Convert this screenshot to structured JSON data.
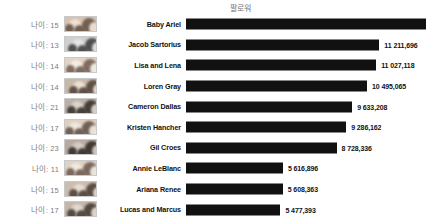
{
  "chart_data": {
    "type": "bar",
    "title": "팔로워",
    "xlabel": "",
    "ylabel": "",
    "orientation": "horizontal",
    "grid": false,
    "legend": false,
    "xlim": [
      0,
      13915130
    ],
    "categories": [
      "Baby Ariel",
      "Jacob Sartorius",
      "Lisa and Lena",
      "Loren Gray",
      "Cameron Dallas",
      "Kristen Hancher",
      "Gil Croes",
      "Annie LeBlanc",
      "Ariana Renee",
      "Lucas and Marcus"
    ],
    "values": [
      13915130,
      11211696,
      11027118,
      10495065,
      9633208,
      9286162,
      8728336,
      5616896,
      5608363,
      5477393
    ],
    "value_labels": [
      "13 915,130",
      "11 211,696",
      "11 027,118",
      "10 495,065",
      "9 633,208",
      "9 286,162",
      "8 728,336",
      "5 616,896",
      "5 608,363",
      "5 477,393"
    ],
    "bar_color": "#111111"
  },
  "rows": [
    {
      "age_label": "나이: 15",
      "name": "Baby Ariel",
      "value_label": "13 915,130",
      "value": 13915130,
      "thumb": "portrait-thumbnail",
      "t1": "#d8c2ae",
      "t2": "#6d5a4c",
      "t3": "#efe3d6"
    },
    {
      "age_label": "나이: 13",
      "name": "Jacob Sartorius",
      "value_label": "11 211,696",
      "value": 11211696,
      "thumb": "portrait-thumbnail",
      "t1": "#cfcfcf",
      "t2": "#4a4a4a",
      "t3": "#e6e6e6"
    },
    {
      "age_label": "나이: 14",
      "name": "Lisa and Lena",
      "value_label": "11 027,118",
      "value": 11027118,
      "thumb": "portrait-thumbnail",
      "t1": "#e2d3c4",
      "t2": "#7a665a",
      "t3": "#f4efe8"
    },
    {
      "age_label": "나이: 14",
      "name": "Loren Gray",
      "value_label": "10 495,065",
      "value": 10495065,
      "thumb": "portrait-thumbnail",
      "t1": "#c8b8a8",
      "t2": "#5b4c42",
      "t3": "#ece2d6"
    },
    {
      "age_label": "나이: 21",
      "name": "Cameron Dallas",
      "value_label": "9 633,208",
      "value": 9633208,
      "thumb": "portrait-thumbnail",
      "t1": "#b9b0a6",
      "t2": "#3f3a35",
      "t3": "#ddd6cd"
    },
    {
      "age_label": "나이: 17",
      "name": "Kristen Hancher",
      "value_label": "9 286,162",
      "value": 9286162,
      "thumb": "portrait-thumbnail",
      "t1": "#ded0c0",
      "t2": "#6b5a50",
      "t3": "#f0e8df"
    },
    {
      "age_label": "나이: 23",
      "name": "Gil Croes",
      "value_label": "8 728,336",
      "value": 8728336,
      "thumb": "portrait-thumbnail",
      "t1": "#b6aba0",
      "t2": "#3b352f",
      "t3": "#d6cec5"
    },
    {
      "age_label": "나이: 11",
      "name": "Annie LeBlanc",
      "value_label": "5 616,896",
      "value": 5616896,
      "thumb": "portrait-thumbnail",
      "t1": "#e0d2c3",
      "t2": "#75635a",
      "t3": "#f2ebe3"
    },
    {
      "age_label": "나이: 15",
      "name": "Ariana Renee",
      "value_label": "5 608,363",
      "value": 5608363,
      "thumb": "portrait-thumbnail",
      "t1": "#cdbdae",
      "t2": "#544841",
      "t3": "#e8ded4"
    },
    {
      "age_label": "나이: 17",
      "name": "Lucas and Marcus",
      "value_label": "5 477,393",
      "value": 5477393,
      "thumb": "portrait-thumbnail",
      "t1": "#c4b6a9",
      "t2": "#4d443c",
      "t3": "#e3dbd1"
    }
  ]
}
